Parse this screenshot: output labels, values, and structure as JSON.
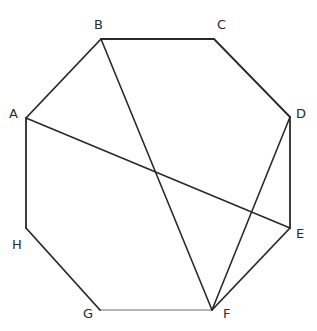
{
  "figure": {
    "name": "labeled-octagon-with-diagonals",
    "width": 317,
    "height": 331,
    "background_color": "#ffffff"
  },
  "style": {
    "edge_color": "#2a2a2a",
    "light_edge_color": "#9a9a9a",
    "diagonal_color": "#2a2a2a",
    "edge_width": 1.8,
    "light_edge_width": 1.6,
    "diagonal_width": 1.6,
    "label_color": "#2b2b2b",
    "label_font_size": 13
  },
  "chart_data": {
    "type": "diagram",
    "title": "",
    "shape": "octagon",
    "vertices": [
      {
        "label": "A",
        "x": 26,
        "y": 118,
        "label_x": 9,
        "label_y": 107
      },
      {
        "label": "B",
        "x": 101,
        "y": 39,
        "label_x": 94,
        "label_y": 18
      },
      {
        "label": "C",
        "x": 214,
        "y": 39,
        "label_x": 217,
        "label_y": 18
      },
      {
        "label": "D",
        "x": 290,
        "y": 117,
        "label_x": 296,
        "label_y": 107
      },
      {
        "label": "E",
        "x": 290,
        "y": 228,
        "label_x": 296,
        "label_y": 227
      },
      {
        "label": "F",
        "x": 212,
        "y": 310,
        "label_x": 223,
        "label_y": 307
      },
      {
        "label": "G",
        "x": 100,
        "y": 310,
        "label_x": 83,
        "label_y": 307
      },
      {
        "label": "H",
        "x": 26,
        "y": 228,
        "label_x": 12,
        "label_y": 238
      }
    ],
    "edges": [
      {
        "from": "A",
        "to": "B",
        "style": "dark"
      },
      {
        "from": "B",
        "to": "C",
        "style": "dark"
      },
      {
        "from": "C",
        "to": "D",
        "style": "dark"
      },
      {
        "from": "D",
        "to": "E",
        "style": "dark"
      },
      {
        "from": "E",
        "to": "F",
        "style": "dark"
      },
      {
        "from": "F",
        "to": "G",
        "style": "light"
      },
      {
        "from": "G",
        "to": "H",
        "style": "dark"
      },
      {
        "from": "H",
        "to": "A",
        "style": "dark"
      }
    ],
    "diagonals": [
      {
        "from": "A",
        "to": "E",
        "style": "dark"
      },
      {
        "from": "B",
        "to": "F",
        "style": "dark"
      },
      {
        "from": "D",
        "to": "F",
        "style": "dark"
      }
    ],
    "intersections": [
      {
        "of": "AE-BF",
        "x": 155,
        "y": 170
      },
      {
        "of": "AE-DF",
        "x": 258,
        "y": 214
      }
    ],
    "xlabel": "",
    "ylabel": "",
    "legend": []
  }
}
